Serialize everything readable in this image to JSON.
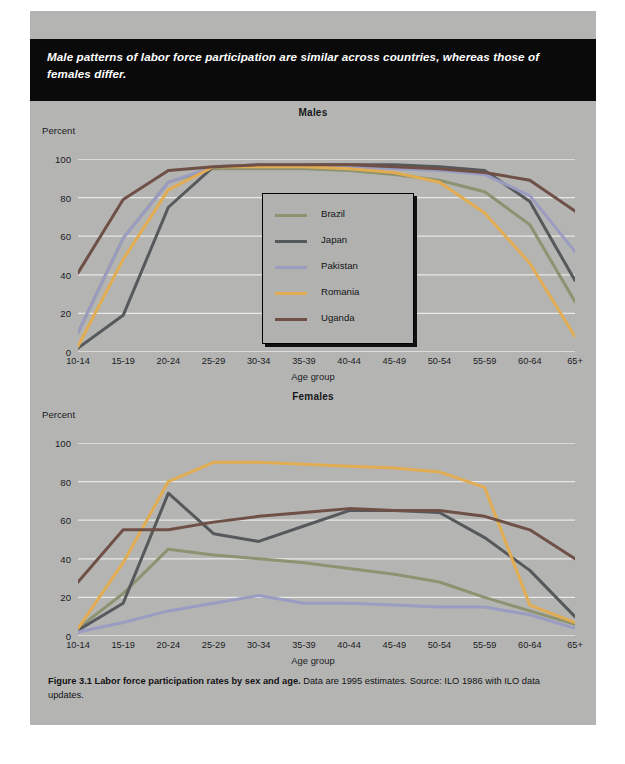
{
  "headline": "Male patterns of labor force participation are similar across countries, whereas those of females differ.",
  "caption": {
    "bold_part": "Figure 3.1  Labor force participation rates by sex and age.",
    "rest": " Data are 1995 estimates. Source: ILO 1986 with ILO data updates."
  },
  "legend": {
    "items": [
      {
        "label": "Brazil",
        "color": "#8d9370"
      },
      {
        "label": "Japan",
        "color": "#55595c"
      },
      {
        "label": "Pakistan",
        "color": "#9a9cc2"
      },
      {
        "label": "Romania",
        "color": "#e2ad52"
      },
      {
        "label": "Uganda",
        "color": "#6e5046"
      }
    ]
  },
  "chart_data": [
    {
      "type": "line",
      "title": "Males",
      "xlabel": "Age group",
      "ylabel": "Percent",
      "ylim": [
        0,
        100
      ],
      "yticks": [
        0,
        20,
        40,
        60,
        80,
        100
      ],
      "grid": true,
      "legend_position": "inside-center",
      "categories": [
        "10-14",
        "15-19",
        "20-24",
        "25-29",
        "30-34",
        "35-39",
        "40-44",
        "45-49",
        "50-54",
        "55-59",
        "60-64",
        "65+"
      ],
      "series": [
        {
          "name": "Brazil",
          "color": "#8d9370",
          "values": [
            10,
            59,
            88,
            95,
            95,
            95,
            94,
            92,
            89,
            83,
            66,
            26
          ]
        },
        {
          "name": "Japan",
          "color": "#55595c",
          "values": [
            2,
            19,
            75,
            96,
            97,
            97,
            97,
            97,
            96,
            94,
            78,
            37
          ]
        },
        {
          "name": "Pakistan",
          "color": "#9a9cc2",
          "values": [
            10,
            59,
            88,
            96,
            97,
            97,
            96,
            95,
            94,
            92,
            81,
            52
          ]
        },
        {
          "name": "Romania",
          "color": "#e2ad52",
          "values": [
            3,
            48,
            84,
            96,
            96,
            96,
            95,
            93,
            88,
            72,
            46,
            8
          ]
        },
        {
          "name": "Uganda",
          "color": "#6e5046",
          "values": [
            41,
            79,
            94,
            96,
            97,
            97,
            97,
            96,
            95,
            93,
            89,
            73
          ]
        }
      ]
    },
    {
      "type": "line",
      "title": "Females",
      "xlabel": "Age group",
      "ylabel": "Percent",
      "ylim": [
        0,
        100
      ],
      "yticks": [
        0,
        20,
        40,
        60,
        80,
        100
      ],
      "grid": true,
      "legend_position": "none",
      "categories": [
        "10-14",
        "15-19",
        "20-24",
        "25-29",
        "30-34",
        "35-39",
        "40-44",
        "45-49",
        "50-54",
        "55-59",
        "60-64",
        "65+"
      ],
      "series": [
        {
          "name": "Brazil",
          "color": "#8d9370",
          "values": [
            4,
            22,
            45,
            42,
            40,
            38,
            35,
            32,
            28,
            20,
            13,
            6
          ]
        },
        {
          "name": "Japan",
          "color": "#55595c",
          "values": [
            3,
            17,
            74,
            53,
            49,
            57,
            65,
            65,
            64,
            51,
            34,
            10
          ]
        },
        {
          "name": "Pakistan",
          "color": "#9a9cc2",
          "values": [
            2,
            7,
            13,
            17,
            21,
            17,
            17,
            16,
            15,
            15,
            11,
            4
          ]
        },
        {
          "name": "Romania",
          "color": "#e2ad52",
          "values": [
            4,
            38,
            80,
            90,
            90,
            89,
            88,
            87,
            85,
            77,
            16,
            7
          ]
        },
        {
          "name": "Uganda",
          "color": "#6e5046",
          "values": [
            28,
            55,
            55,
            59,
            62,
            64,
            66,
            65,
            65,
            62,
            55,
            40
          ]
        }
      ]
    }
  ]
}
